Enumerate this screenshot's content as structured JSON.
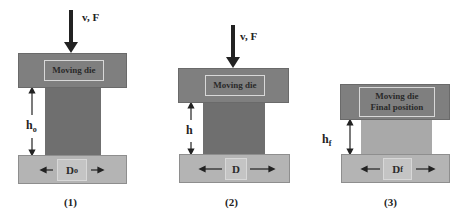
{
  "panels": [
    {
      "id": "1",
      "caption": "(1)",
      "force_label": "v, F",
      "top_die_label": "Moving die",
      "height_label": "h",
      "height_sub": "o",
      "diameter_label": "D",
      "diameter_sub": "o"
    },
    {
      "id": "2",
      "caption": "(2)",
      "force_label": "v, F",
      "top_die_label": "Moving die",
      "height_label": "h",
      "height_sub": "",
      "diameter_label": "D",
      "diameter_sub": ""
    },
    {
      "id": "3",
      "caption": "(3)",
      "top_die_label_line1": "Moving die",
      "top_die_label_line2": "Final position",
      "height_label": "h",
      "height_sub": "f",
      "diameter_label": "D",
      "diameter_sub": "f"
    }
  ],
  "colors": {
    "top_die": "#7f7f7f",
    "bottom_die": "#b4b4b4",
    "workpiece": "#6f6f6f",
    "workpiece_final": "#a9a9a9"
  }
}
